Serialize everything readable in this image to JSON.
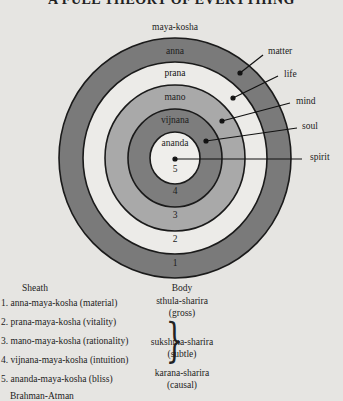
{
  "title": "A FULL THEORY OF EVERYTHING",
  "diagram": {
    "outer_label": "maya-kosha",
    "rings": [
      {
        "name": "anna",
        "number": "1",
        "color": "#7a7a7a"
      },
      {
        "name": "prana",
        "number": "2",
        "color": "#ecebe8"
      },
      {
        "name": "mano",
        "number": "3",
        "color": "#a9a9a9"
      },
      {
        "name": "vijnana",
        "number": "4",
        "color": "#7d7d7d"
      },
      {
        "name": "ananda",
        "number": "5",
        "color": "#efeeeb"
      }
    ],
    "annotations": [
      {
        "label": "matter"
      },
      {
        "label": "life"
      },
      {
        "label": "mind"
      },
      {
        "label": "soul"
      },
      {
        "label": "spirit"
      }
    ]
  },
  "table": {
    "headers": {
      "sheath": "Sheath",
      "body": "Body"
    },
    "sheaths": [
      "1. anna-maya-kosha (material)",
      "2. prana-maya-kosha (vitality)",
      "3. mano-maya-kosha (rationality)",
      "4. vijnana-maya-kosha (intuition)",
      "5. ananda-maya-kosha (bliss)",
      "Brahman-Atman"
    ],
    "bodies": [
      {
        "name": "sthula-sharira",
        "gloss": "(gross)"
      },
      {
        "name": "sukshma-sharira",
        "gloss": "(subtle)"
      },
      {
        "name": "karana-sharira",
        "gloss": "(causal)"
      }
    ],
    "brace": "}"
  }
}
